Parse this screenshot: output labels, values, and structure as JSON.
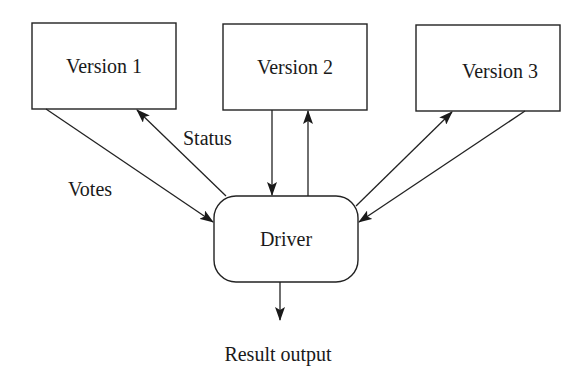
{
  "diagram": {
    "type": "flow-diagram",
    "colors": {
      "stroke": "#222222",
      "text": "#1a1a1a",
      "background": "#ffffff"
    },
    "nodes": [
      {
        "id": "version1",
        "label": "Version 1",
        "shape": "rectangle"
      },
      {
        "id": "version2",
        "label": "Version 2",
        "shape": "rectangle"
      },
      {
        "id": "version3",
        "label": "Version 3",
        "shape": "rectangle"
      },
      {
        "id": "driver",
        "label": "Driver",
        "shape": "rounded-rectangle"
      }
    ],
    "edges": [
      {
        "from": "version1",
        "to": "driver",
        "label": "Votes"
      },
      {
        "from": "driver",
        "to": "version1",
        "label": "Status"
      },
      {
        "from": "version2",
        "to": "driver",
        "label": ""
      },
      {
        "from": "driver",
        "to": "version2",
        "label": ""
      },
      {
        "from": "driver",
        "to": "version3",
        "label": ""
      },
      {
        "from": "version3",
        "to": "driver",
        "label": ""
      },
      {
        "from": "driver",
        "to": "output",
        "label": ""
      }
    ],
    "labels": {
      "votes": "Votes",
      "status": "Status",
      "result_output": "Result output"
    }
  }
}
